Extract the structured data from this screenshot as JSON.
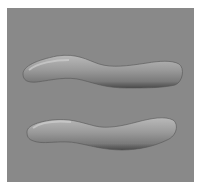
{
  "image": {
    "description": "DIC microscopy image of two elongated rod-shaped cells on a gray background",
    "background_color": "#898989",
    "frame_color": "#ffffff",
    "objects": [
      {
        "name": "upper-cell",
        "shape": "curved rod"
      },
      {
        "name": "lower-cell",
        "shape": "curved rod"
      }
    ]
  }
}
